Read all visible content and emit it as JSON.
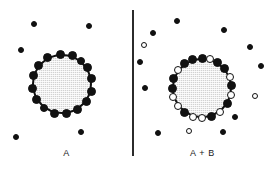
{
  "figure": {
    "type": "binding-schematic",
    "background_color": "#ffffff",
    "divider": {
      "color": "#2b2b2b",
      "orientation": "vertical"
    }
  },
  "legend_colors": {
    "cell_fill": "#d2d2d2",
    "cell_outline": "#111111",
    "ligand_a_filled": "#111111",
    "ligand_b_open": "#ffffff",
    "marker_outline": "#111111"
  },
  "panels": [
    {
      "id": "panel-a",
      "caption": "A",
      "cell": {
        "cx": 62,
        "cy": 84,
        "r": 30
      },
      "bound_markers": [
        {
          "type": "filled",
          "angle": 268,
          "size": 9
        },
        {
          "type": "filled",
          "angle": 290,
          "size": 9
        },
        {
          "type": "filled",
          "angle": 309,
          "size": 8
        },
        {
          "type": "filled",
          "angle": 327,
          "size": 9
        },
        {
          "type": "filled",
          "angle": 350,
          "size": 9
        },
        {
          "type": "filled",
          "angle": 14,
          "size": 9
        },
        {
          "type": "filled",
          "angle": 36,
          "size": 9
        },
        {
          "type": "filled",
          "angle": 60,
          "size": 9
        },
        {
          "type": "filled",
          "angle": 82,
          "size": 9
        },
        {
          "type": "filled",
          "angle": 104,
          "size": 9
        },
        {
          "type": "filled",
          "angle": 126,
          "size": 8
        },
        {
          "type": "filled",
          "angle": 150,
          "size": 9
        },
        {
          "type": "filled",
          "angle": 172,
          "size": 9
        },
        {
          "type": "filled",
          "angle": 196,
          "size": 9
        },
        {
          "type": "filled",
          "angle": 218,
          "size": 9
        },
        {
          "type": "filled",
          "angle": 242,
          "size": 9
        }
      ],
      "free_markers": [
        {
          "type": "filled",
          "x": 34,
          "y": 24,
          "size": 6
        },
        {
          "type": "filled",
          "x": 89,
          "y": 26,
          "size": 6
        },
        {
          "type": "filled",
          "x": 21,
          "y": 50,
          "size": 6
        },
        {
          "type": "filled",
          "x": 16,
          "y": 137,
          "size": 6
        },
        {
          "type": "filled",
          "x": 81,
          "y": 132,
          "size": 6
        },
        {
          "type": "filled",
          "x": 54,
          "y": 114,
          "size": 6
        }
      ]
    },
    {
      "id": "panel-b",
      "caption": "A + B",
      "cell": {
        "cx": 68,
        "cy": 88,
        "r": 30
      },
      "bound_markers": [
        {
          "type": "filled",
          "angle": 270,
          "size": 9
        },
        {
          "type": "open",
          "angle": 286,
          "size": 8
        },
        {
          "type": "filled",
          "angle": 302,
          "size": 9
        },
        {
          "type": "filled",
          "angle": 320,
          "size": 9
        },
        {
          "type": "open",
          "angle": 338,
          "size": 8
        },
        {
          "type": "filled",
          "angle": 356,
          "size": 9
        },
        {
          "type": "open",
          "angle": 14,
          "size": 8
        },
        {
          "type": "filled",
          "angle": 32,
          "size": 9
        },
        {
          "type": "open",
          "angle": 52,
          "size": 8
        },
        {
          "type": "filled",
          "angle": 72,
          "size": 9
        },
        {
          "type": "open",
          "angle": 90,
          "size": 8
        },
        {
          "type": "open",
          "angle": 108,
          "size": 8
        },
        {
          "type": "filled",
          "angle": 126,
          "size": 9
        },
        {
          "type": "open",
          "angle": 144,
          "size": 8
        },
        {
          "type": "open",
          "angle": 162,
          "size": 8
        },
        {
          "type": "filled",
          "angle": 180,
          "size": 9
        },
        {
          "type": "filled",
          "angle": 198,
          "size": 9
        },
        {
          "type": "open",
          "angle": 216,
          "size": 8
        },
        {
          "type": "filled",
          "angle": 234,
          "size": 9
        },
        {
          "type": "filled",
          "angle": 252,
          "size": 9
        }
      ],
      "free_markers": [
        {
          "type": "filled",
          "x": 43,
          "y": 21,
          "size": 6
        },
        {
          "type": "filled",
          "x": 90,
          "y": 30,
          "size": 6
        },
        {
          "type": "filled",
          "x": 19,
          "y": 33,
          "size": 6
        },
        {
          "type": "open",
          "x": 10,
          "y": 45,
          "size": 6
        },
        {
          "type": "filled",
          "x": 116,
          "y": 47,
          "size": 6
        },
        {
          "type": "filled",
          "x": 6,
          "y": 62,
          "size": 6
        },
        {
          "type": "filled",
          "x": 127,
          "y": 66,
          "size": 6
        },
        {
          "type": "filled",
          "x": 11,
          "y": 88,
          "size": 6
        },
        {
          "type": "open",
          "x": 121,
          "y": 96,
          "size": 6
        },
        {
          "type": "filled",
          "x": 101,
          "y": 117,
          "size": 6
        },
        {
          "type": "filled",
          "x": 24,
          "y": 133,
          "size": 6
        },
        {
          "type": "open",
          "x": 55,
          "y": 131,
          "size": 6
        },
        {
          "type": "filled",
          "x": 89,
          "y": 132,
          "size": 6
        }
      ]
    }
  ]
}
